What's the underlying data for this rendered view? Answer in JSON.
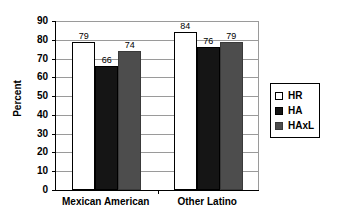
{
  "chart_data": {
    "type": "bar",
    "title": "",
    "xlabel": "",
    "ylabel": "Percent",
    "ylim": [
      0,
      90
    ],
    "ytick_step": 10,
    "yticks": [
      90,
      80,
      70,
      60,
      50,
      40,
      30,
      20,
      10,
      0
    ],
    "grid": true,
    "legend_position": "right",
    "categories": [
      "Mexican American",
      "Other Latino"
    ],
    "series": [
      {
        "name": "HR",
        "color": "#ffffff",
        "values": [
          79,
          84
        ]
      },
      {
        "name": "HA",
        "color": "#151515",
        "values": [
          66,
          76
        ]
      },
      {
        "name": "HAxL",
        "color": "#4d4d4d",
        "values": [
          74,
          79
        ]
      }
    ]
  },
  "legend": {
    "items": [
      {
        "label": "HR",
        "swatch": "hr"
      },
      {
        "label": "HA",
        "swatch": "ha"
      },
      {
        "label": "HAxL",
        "swatch": "haxl"
      }
    ]
  }
}
